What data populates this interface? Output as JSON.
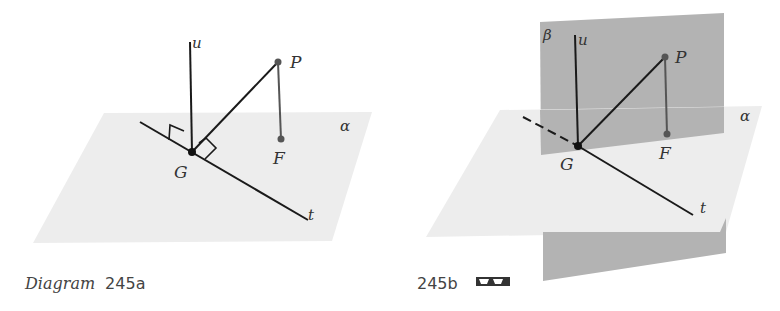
{
  "diagram_a": {
    "caption_prefix": "Diagram",
    "caption_number": "245a",
    "labels": {
      "u": "u",
      "P": "P",
      "F": "F",
      "G": "G",
      "t": "t",
      "alpha": "α"
    }
  },
  "diagram_b": {
    "caption_number": "245b",
    "glasses_icon": "3d-glasses-icon",
    "labels": {
      "beta": "β",
      "u": "u",
      "P": "P",
      "F": "F",
      "G": "G",
      "t": "t",
      "alpha": "α"
    }
  },
  "colors": {
    "plane_alpha": "#ededed",
    "plane_beta": "#b3b3b3",
    "line": "#1a1a1a",
    "point": "#555555"
  }
}
